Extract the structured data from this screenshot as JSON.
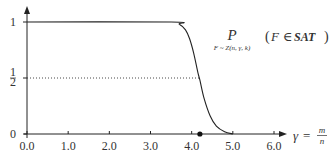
{
  "chart_data": {
    "type": "line",
    "title": "",
    "xlabel": "γ = m/n",
    "xlabel_parts": {
      "symbol": "γ",
      "equals": "=",
      "num": "m",
      "den": "n"
    },
    "ylabel": "",
    "xlim": [
      0.0,
      6.0
    ],
    "ylim": [
      0,
      1
    ],
    "x_ticks": [
      0.0,
      1.0,
      2.0,
      3.0,
      4.0,
      5.0,
      6.0
    ],
    "x_tick_labels": [
      "0.0",
      "1.0",
      "2.0",
      "3.0",
      "4.0",
      "5.0",
      "6.0"
    ],
    "y_ticks": [
      0,
      0.5,
      1
    ],
    "y_tick_labels": [
      "0",
      "1/2",
      "1"
    ],
    "y_tick_half": {
      "num": "1",
      "den": "2"
    },
    "grid": false,
    "legend": "none",
    "series": [
      {
        "name": "P(F ∈ SAT)",
        "x": [
          0.0,
          3.5,
          3.7,
          3.85,
          3.95,
          4.05,
          4.15,
          4.2,
          4.3,
          4.45,
          4.6,
          4.8,
          5.0
        ],
        "values": [
          1.0,
          1.0,
          0.98,
          0.93,
          0.85,
          0.72,
          0.55,
          0.48,
          0.32,
          0.16,
          0.07,
          0.02,
          0.0
        ]
      }
    ],
    "reference_lines": [
      {
        "type": "horizontal",
        "y": 0.5,
        "style": "dotted",
        "x_end": 4.2
      }
    ],
    "markers": [
      {
        "x": 4.2,
        "y": 0,
        "label": "threshold"
      }
    ],
    "annotation": {
      "prob": "P",
      "subscript": "F ~ Z(n, γ, k)",
      "event_open": "(",
      "event_var": "F",
      "event_in": "∈",
      "event_set": "SAT",
      "event_close": ")"
    }
  }
}
